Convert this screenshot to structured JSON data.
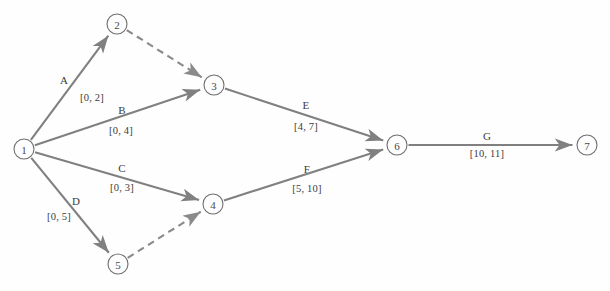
{
  "diagram": {
    "type": "activity-on-arrow-network",
    "background_color": "#fefefe",
    "node_stroke_color": "#6e6e6e",
    "edge_color": "#808080",
    "dashed_edge_color": "#8a8a8a",
    "label_color": "#3c3c3c"
  },
  "nodes": [
    {
      "id": "1",
      "label": "1",
      "x": 24,
      "y": 149,
      "r": 10
    },
    {
      "id": "2",
      "label": "2",
      "x": 117,
      "y": 24,
      "r": 10
    },
    {
      "id": "3",
      "label": "3",
      "x": 214,
      "y": 85,
      "r": 10
    },
    {
      "id": "4",
      "label": "4",
      "x": 213,
      "y": 204,
      "r": 10
    },
    {
      "id": "5",
      "label": "5",
      "x": 118,
      "y": 264,
      "r": 10
    },
    {
      "id": "6",
      "label": "6",
      "x": 397,
      "y": 145,
      "r": 10
    },
    {
      "id": "7",
      "label": "7",
      "x": 587,
      "y": 145,
      "r": 10
    }
  ],
  "edges": [
    {
      "id": "A",
      "from": "1",
      "to": "2",
      "style": "solid",
      "arrow": true,
      "name": "A",
      "interval": "[0, 2]",
      "name_x": 64,
      "name_y": 80,
      "interval_x": 92,
      "interval_y": 97
    },
    {
      "id": "B",
      "from": "1",
      "to": "3",
      "style": "solid",
      "arrow": true,
      "name": "B",
      "interval": "[0, 4]",
      "name_x": 122,
      "name_y": 110,
      "interval_x": 121,
      "interval_y": 130
    },
    {
      "id": "C",
      "from": "1",
      "to": "4",
      "style": "solid",
      "arrow": true,
      "name": "C",
      "interval": "[0, 3]",
      "name_x": 122,
      "name_y": 168,
      "interval_x": 122,
      "interval_y": 187
    },
    {
      "id": "D",
      "from": "1",
      "to": "5",
      "style": "solid",
      "arrow": true,
      "name": "D",
      "interval": "[0, 5]",
      "name_x": 76,
      "name_y": 201,
      "interval_x": 59,
      "interval_y": 216
    },
    {
      "id": "dummy-2-3",
      "from": "2",
      "to": "3",
      "style": "dashed",
      "arrow": true,
      "name": "",
      "interval": "",
      "name_x": null,
      "name_y": null,
      "interval_x": null,
      "interval_y": null
    },
    {
      "id": "dummy-5-4",
      "from": "5",
      "to": "4",
      "style": "dashed",
      "arrow": true,
      "name": "",
      "interval": "",
      "name_x": null,
      "name_y": null,
      "interval_x": null,
      "interval_y": null
    },
    {
      "id": "E",
      "from": "3",
      "to": "6",
      "style": "solid",
      "arrow": true,
      "name": "E",
      "interval": "[4, 7]",
      "name_x": 306,
      "name_y": 105,
      "interval_x": 306,
      "interval_y": 126
    },
    {
      "id": "F",
      "from": "4",
      "to": "6",
      "style": "solid",
      "arrow": true,
      "name": "F",
      "interval": "[5, 10]",
      "name_x": 307,
      "name_y": 169,
      "interval_x": 307,
      "interval_y": 188
    },
    {
      "id": "G",
      "from": "6",
      "to": "7",
      "style": "solid",
      "arrow": true,
      "name": "G",
      "interval": "[10, 11]",
      "name_x": 487,
      "name_y": 136,
      "interval_x": 487,
      "interval_y": 153
    }
  ]
}
